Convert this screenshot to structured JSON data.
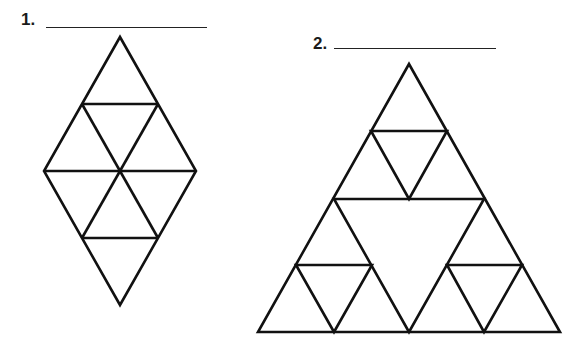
{
  "problems": [
    {
      "number": "1.",
      "shape": "rhombus made of 8 equilateral triangles (hexagon-based diamond)"
    },
    {
      "number": "2.",
      "shape": "Sierpinski triangle, 2 levels"
    }
  ],
  "colors": {
    "stroke": "#111111",
    "background": "#ffffff"
  }
}
